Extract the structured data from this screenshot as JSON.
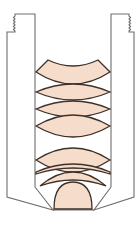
{
  "diagram": {
    "colors": {
      "housing_stroke": "#6e6e6e",
      "lens_fill": "#f6dccb",
      "lens_stroke": "#3d3028",
      "background": "#ffffff"
    },
    "components": [
      {
        "id": "housing-left",
        "label": "Barrel wall (left, threaded)"
      },
      {
        "id": "housing-right",
        "label": "Barrel wall (right, threaded)"
      },
      {
        "id": "lens-1",
        "label": "Meniscus lens"
      },
      {
        "id": "lens-2",
        "label": "Biconvex lens"
      },
      {
        "id": "lens-3",
        "label": "Biconvex lens"
      },
      {
        "id": "lens-4",
        "label": "Biconvex lens"
      },
      {
        "id": "lens-5",
        "label": "Meniscus lens"
      },
      {
        "id": "lens-6",
        "label": "Meniscus lens"
      },
      {
        "id": "lens-7",
        "label": "Plano-convex front lens"
      }
    ]
  }
}
